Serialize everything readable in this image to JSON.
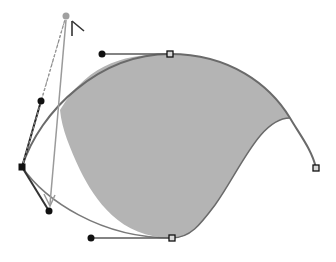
{
  "diagram": {
    "type": "bezier-path-editing",
    "width": 336,
    "height": 262,
    "colors": {
      "background": "#ffffff",
      "fill": "#b4b4b4",
      "path_stroke": "#6a6a6a",
      "handle_line": "#5a5a5a",
      "handle_dot": "#111111",
      "anchor_selected": "#111111",
      "anchor_unselected_fill": "#d8d8d8",
      "anchor_unselected_stroke": "#111111",
      "drag_line": "#9a9a9a",
      "ghost_dot": "#a0a0a0",
      "cursor": "#333333"
    },
    "anchors": [
      {
        "name": "anchor-top",
        "x": 170,
        "y": 54,
        "selected": false
      },
      {
        "name": "anchor-left",
        "x": 22,
        "y": 167,
        "selected": true
      },
      {
        "name": "anchor-bottom",
        "x": 172,
        "y": 238,
        "selected": false
      },
      {
        "name": "anchor-end",
        "x": 316,
        "y": 168,
        "selected": false
      }
    ],
    "handles": [
      {
        "name": "handle-top",
        "anchor": "anchor-top",
        "x": 102,
        "y": 54
      },
      {
        "name": "handle-left-in",
        "anchor": "anchor-left",
        "x": 41,
        "y": 101
      },
      {
        "name": "handle-left-out",
        "anchor": "anchor-left",
        "x": 49,
        "y": 211
      },
      {
        "name": "handle-bottom",
        "anchor": "anchor-bottom",
        "x": 91,
        "y": 238
      }
    ],
    "drag": {
      "ghost_point": {
        "x": 66,
        "y": 16
      },
      "arrow_end": {
        "x": 50,
        "y": 206
      },
      "cursor": {
        "x": 72,
        "y": 21
      }
    }
  }
}
